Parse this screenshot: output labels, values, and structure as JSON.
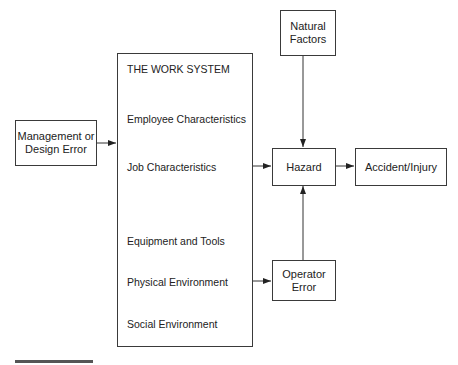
{
  "diagram": {
    "type": "flow-diagram",
    "boxes": {
      "management": {
        "label": "Management or\nDesign Error"
      },
      "work_system": {
        "title": "THE WORK SYSTEM",
        "items": [
          "Employee Characteristics",
          "Job Characteristics",
          "Equipment and Tools",
          "Physical Environment",
          "Social Environment"
        ]
      },
      "natural_factors": {
        "label": "Natural\nFactors"
      },
      "hazard": {
        "label": "Hazard"
      },
      "accident": {
        "label": "Accident/Injury"
      },
      "operator_error": {
        "label": "Operator\nError"
      }
    },
    "edges": [
      {
        "from": "Management or Design Error",
        "to": "THE WORK SYSTEM"
      },
      {
        "from": "Job Characteristics",
        "to": "Hazard"
      },
      {
        "from": "Natural Factors",
        "to": "Hazard"
      },
      {
        "from": "Hazard",
        "to": "Accident/Injury"
      },
      {
        "from": "Physical Environment",
        "to": "Operator Error"
      },
      {
        "from": "Operator Error",
        "to": "Hazard"
      }
    ],
    "colors": {
      "line": "#3a3a3a",
      "text": "#222222",
      "background": "#ffffff"
    }
  }
}
